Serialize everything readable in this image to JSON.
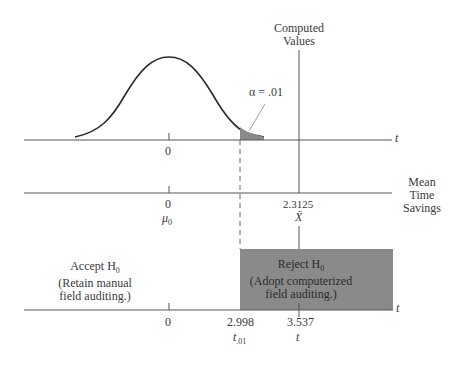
{
  "diagram": {
    "computed_values_label_1": "Computed",
    "computed_values_label_2": "Values",
    "alpha_label": "α = .01",
    "top_axis": {
      "var_label": "t",
      "zero_label": "0"
    },
    "middle_axis": {
      "title_1": "Mean",
      "title_2": "Time",
      "title_3": "Savings",
      "zero_label": "0",
      "mu_label": "μ",
      "mu_sub": "0",
      "xbar_value": "2.3125",
      "xbar_label": "X̄"
    },
    "bottom_axis": {
      "var_label": "t",
      "zero_label": "0",
      "critical_value": "2.998",
      "critical_label": "t",
      "critical_sub": ".01",
      "computed_value": "3.537",
      "computed_label": "t"
    },
    "accept_region": {
      "title": "Accept H",
      "title_sub": "0",
      "line1": "(Retain manual",
      "line2": "field auditing.)"
    },
    "reject_region": {
      "title": "Reject H",
      "title_sub": "0",
      "line1": "(Adopt computerized",
      "line2": "field auditing.)"
    },
    "colors": {
      "line": "#3a3a3a",
      "shade": "#8a8a8a"
    }
  }
}
